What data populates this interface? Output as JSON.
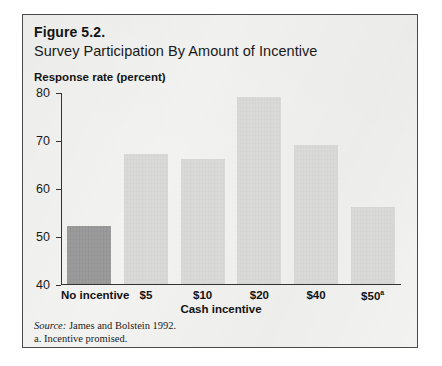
{
  "figure": {
    "label": "Figure 5.2.",
    "title": "Survey Participation By Amount of Incentive",
    "source_word": "Source:",
    "source_text": " James and Bolstein 1992.",
    "footnote": "a. Incentive promised."
  },
  "chart_data": {
    "type": "bar",
    "title": "Survey Participation By Amount of Incentive",
    "xlabel": "Cash incentive",
    "ylabel": "Response rate (percent)",
    "categories": [
      "No incentive",
      "$5",
      "$10",
      "$20",
      "$40",
      "$50"
    ],
    "category_labels": [
      "No incentive",
      "$5",
      "$10",
      "$20",
      "$40",
      "$50a"
    ],
    "values": [
      52,
      67,
      66,
      79,
      69,
      56
    ],
    "ylim": [
      40,
      80
    ],
    "yticks": [
      40,
      50,
      60,
      70,
      80
    ],
    "ytick_labels": [
      "40",
      "50",
      "60",
      "70",
      "80"
    ],
    "grid": false,
    "legend": false,
    "bar_colors": [
      "#9b9b9b",
      "#d9d9d7",
      "#d9d9d7",
      "#d9d9d7",
      "#d9d9d7",
      "#d9d9d7"
    ],
    "highlight_index": 0,
    "footnote_marker_category": "$50",
    "footnote_marker": "a"
  }
}
